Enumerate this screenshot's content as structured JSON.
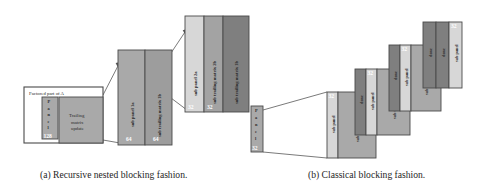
{
  "figure": {
    "captions": {
      "a": "(a) Recursive nested blocking fashion.",
      "b": "(b) Classical blocking fashion."
    },
    "colors": {
      "light": "#d7d7d7",
      "medium": "#a9a9a9",
      "dark": "#7f7f7f",
      "outline": "#4a4a4a",
      "white": "#ffffff",
      "text": "#2b2b2b"
    },
    "panel_a": {
      "frame_label": "Factored part of A",
      "panel_word_chars": [
        "P",
        "a",
        "n",
        "e",
        "l"
      ],
      "level0": {
        "panel_size": "128",
        "trailing_lines": [
          "Trailing",
          "matrix",
          "update"
        ]
      },
      "level1": {
        "blocks": [
          {
            "label": "sub panel 1a",
            "size": "64"
          },
          {
            "label": "sub trailing matrix 1b",
            "size": "64"
          }
        ]
      },
      "level2": {
        "blocks": [
          {
            "label": "sub panel 2a",
            "size": "32"
          },
          {
            "label": "sub trailing matrix 2b",
            "size": "32"
          },
          {
            "label": "sub trailing matrix 1b",
            "size": ""
          }
        ]
      }
    },
    "panel_b": {
      "panel_word_chars": [
        "P",
        "a",
        "n",
        "e",
        "l"
      ],
      "panel_size": "32",
      "steps": [
        {
          "sub_panel_label": "sub panel",
          "sub_panel_size": "32",
          "trailing_label": "sub trailing matrix",
          "done_labels": []
        },
        {
          "sub_panel_label": "sub panel",
          "sub_panel_size": "32",
          "trailing_label": "sub trailing matrix",
          "done_labels": [
            "done"
          ]
        },
        {
          "sub_panel_label": "sub panel",
          "sub_panel_size": "32",
          "trailing_label": "sub trailing matrix",
          "done_labels": [
            "done"
          ]
        },
        {
          "sub_panel_label": "sub panel",
          "sub_panel_size": "32",
          "trailing_label": "",
          "done_labels": [
            "done",
            "done"
          ]
        }
      ]
    }
  }
}
